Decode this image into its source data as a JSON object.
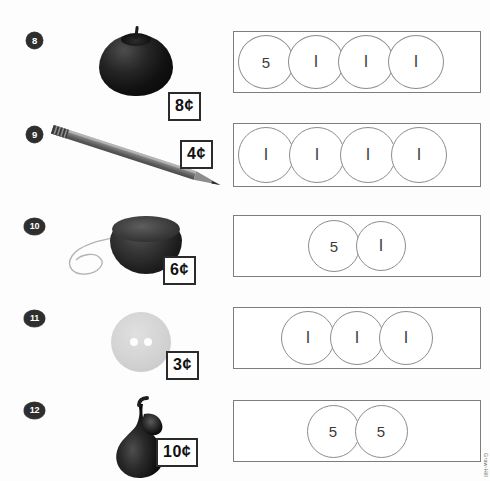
{
  "page": {
    "credit": "Graw-Hill",
    "colors": {
      "page_background": "#fdfdfd",
      "box_border": "#7d7d7d",
      "coin_border": "#8c8c8c",
      "badge_fill": "#2e2e2e",
      "price_border": "#2b2b2b",
      "ink": "#111111"
    }
  },
  "problems": [
    {
      "number": "8",
      "item_name": "apple",
      "item_icon": "apple-icon",
      "price": "8¢",
      "box": {
        "alignment": "left",
        "coins": [
          {
            "value": "5",
            "type": "nickel"
          },
          {
            "value": "I",
            "type": "penny"
          },
          {
            "value": "I",
            "type": "penny"
          },
          {
            "value": "I",
            "type": "penny"
          }
        ]
      }
    },
    {
      "number": "9",
      "item_name": "pencil",
      "item_icon": "pencil-icon",
      "price": "4¢",
      "box": {
        "alignment": "left",
        "coins": [
          {
            "value": "I",
            "type": "penny"
          },
          {
            "value": "I",
            "type": "penny"
          },
          {
            "value": "I",
            "type": "penny"
          },
          {
            "value": "I",
            "type": "penny"
          }
        ]
      }
    },
    {
      "number": "10",
      "item_name": "yo-yo",
      "item_icon": "yoyo-icon",
      "price": "6¢",
      "box": {
        "alignment": "center",
        "coins": [
          {
            "value": "5",
            "type": "nickel"
          },
          {
            "value": "I",
            "type": "penny"
          }
        ]
      }
    },
    {
      "number": "11",
      "item_name": "button",
      "item_icon": "button-icon",
      "price": "3¢",
      "box": {
        "alignment": "center",
        "coins": [
          {
            "value": "I",
            "type": "penny"
          },
          {
            "value": "I",
            "type": "penny"
          },
          {
            "value": "I",
            "type": "penny"
          }
        ]
      }
    },
    {
      "number": "12",
      "item_name": "pear",
      "item_icon": "pear-icon",
      "price": "10¢",
      "box": {
        "alignment": "center",
        "coins": [
          {
            "value": "5",
            "type": "nickel"
          },
          {
            "value": "5",
            "type": "nickel"
          }
        ]
      }
    }
  ]
}
